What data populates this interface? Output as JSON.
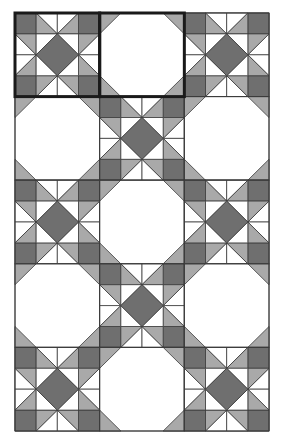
{
  "diagram": {
    "origin": [
      15,
      13
    ],
    "block_width": 84.67,
    "block_height": 83.6,
    "units_per_block": 4,
    "columns": 3,
    "rows": 5,
    "layout": [
      [
        "star",
        "plain",
        "star"
      ],
      [
        "plain",
        "star",
        "plain"
      ],
      [
        "star",
        "plain",
        "star"
      ],
      [
        "plain",
        "star",
        "plain"
      ],
      [
        "star",
        "plain",
        "star"
      ]
    ],
    "highlight": {
      "row": 0,
      "col_start": 0,
      "col_end": 1,
      "label": "block-pair-highlight"
    }
  },
  "colors": {
    "background": "#ffffff",
    "dark": "#6f6f6f",
    "light": "#a9a9a9",
    "white": "#ffffff",
    "line": "#3a3a3a",
    "highlight_line": "#1a1a1a"
  }
}
